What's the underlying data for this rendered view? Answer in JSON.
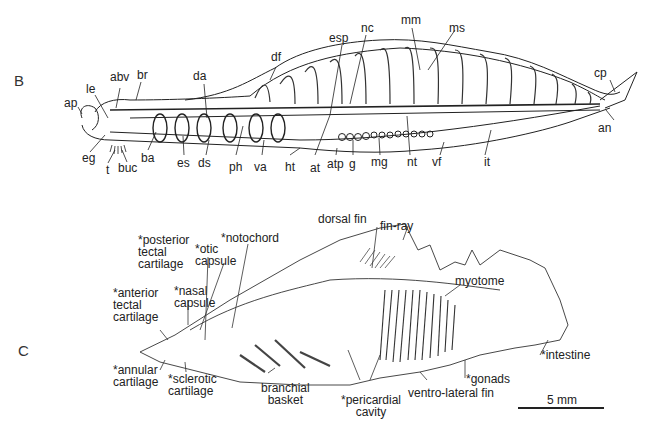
{
  "figure": {
    "panels": [
      {
        "id": "B",
        "letter": "B",
        "labels": {
          "ap": "ap",
          "le": "le",
          "abv": "abv",
          "br": "br",
          "da": "da",
          "df": "df",
          "esp": "esp",
          "nc": "nc",
          "mm": "mm",
          "ms": "ms",
          "cp": "cp",
          "an": "an",
          "eg": "eg",
          "t": "t",
          "buc": "buc",
          "ba": "ba",
          "es": "es",
          "ds": "ds",
          "ph": "ph",
          "va": "va",
          "ht": "ht",
          "at": "at",
          "atp": "atp",
          "g": "g",
          "mg": "mg",
          "nt": "nt",
          "vf": "vf",
          "it": "it"
        }
      },
      {
        "id": "C",
        "letter": "C",
        "labels": {
          "posterior_tectal": "*posterior\ntectal\ncartilage",
          "otic_capsule": "*otic\ncapsule",
          "notochord": "*notochord",
          "dorsal_fin": "dorsal fin",
          "fin_ray": "fin-ray",
          "anterior_tectal": "*anterior\ntectal\ncartilage",
          "nasal_capsule": "*nasal\ncapsule",
          "myotome": "myotome",
          "intestine": "*intestine",
          "annular": "*annular\ncartilage",
          "sclerotic": "*sclerotic\ncartilage",
          "branchial": "branchial\nbasket",
          "pericardial": "*pericardial\ncavity",
          "gonads": "*gonads",
          "ventro_lateral": "ventro-lateral fin"
        },
        "scale_bar": "5 mm"
      }
    ]
  }
}
